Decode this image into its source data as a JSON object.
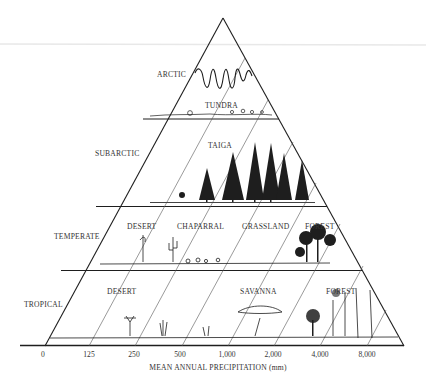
{
  "diagram": {
    "title": "",
    "zones": [
      {
        "name": "ARCTIC",
        "biomes": [
          "TUNDRA"
        ]
      },
      {
        "name": "SUBARCTIC",
        "biomes": [
          "TAIGA"
        ]
      },
      {
        "name": "TEMPERATE",
        "biomes": [
          "DESERT",
          "CHAPARRAL",
          "GRASSLAND",
          "FOREST"
        ]
      },
      {
        "name": "TROPICAL",
        "biomes": [
          "DESERT",
          "SAVANNA",
          "FOREST"
        ]
      }
    ],
    "labels": {
      "arctic": "ARCTIC",
      "tundra": "TUNDRA",
      "subarctic": "SUBARCTIC",
      "taiga": "TAIGA",
      "temperate": "TEMPERATE",
      "temperate_desert": "DESERT",
      "chaparral": "CHAPARRAL",
      "grassland": "GRASSLAND",
      "temperate_forest": "FOREST",
      "tropical": "TROPICAL",
      "tropical_desert": "DESERT",
      "savanna": "SAVANNA",
      "tropical_forest": "FOREST"
    },
    "x_axis": {
      "title": "MEAN ANNUAL PRECIPITATION (mm)",
      "ticks": [
        "0",
        "125",
        "250",
        "500",
        "1,000",
        "2,000",
        "4,000",
        "8,000"
      ]
    },
    "colors": {
      "ink": "#1e1e1e",
      "background": "#ffffff",
      "faint_line": "#e6e6e6"
    }
  }
}
